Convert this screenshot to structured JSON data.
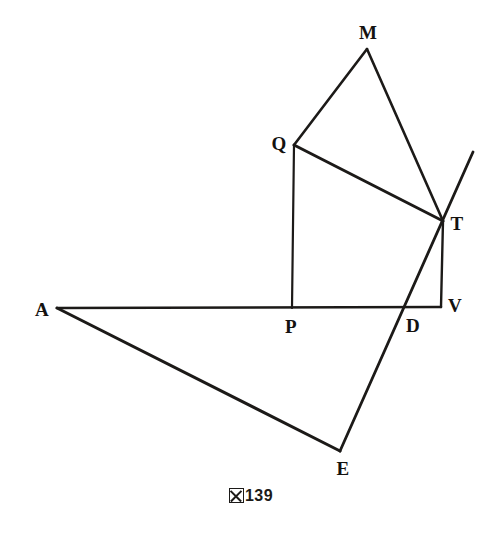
{
  "figure": {
    "caption_symbol": "図",
    "caption_number": "139",
    "caption_full": "図139",
    "canvas": {
      "width": 502,
      "height": 534,
      "background": "#ffffff"
    },
    "stroke_color": "#1c1a18",
    "label_color": "#141210",
    "points": [
      {
        "id": "M",
        "label": "M",
        "x": 367,
        "y": 49,
        "label_x": 368,
        "label_y": 32
      },
      {
        "id": "Q",
        "label": "Q",
        "x": 294,
        "y": 145,
        "label_x": 279,
        "label_y": 143
      },
      {
        "id": "T",
        "label": "T",
        "x": 443,
        "y": 221,
        "label_x": 457,
        "label_y": 223
      },
      {
        "id": "R",
        "label": "",
        "x": 473,
        "y": 152,
        "label_x": 473,
        "label_y": 152
      },
      {
        "id": "P",
        "label": "P",
        "x": 292,
        "y": 308,
        "label_x": 291,
        "label_y": 326
      },
      {
        "id": "D",
        "label": "D",
        "x": 402,
        "y": 307,
        "label_x": 413,
        "label_y": 325
      },
      {
        "id": "V",
        "label": "V",
        "x": 441,
        "y": 307,
        "label_x": 455,
        "label_y": 305
      },
      {
        "id": "A",
        "label": "A",
        "x": 57,
        "y": 308,
        "label_x": 42,
        "label_y": 309
      },
      {
        "id": "E",
        "label": "E",
        "x": 340,
        "y": 451,
        "label_x": 343,
        "label_y": 468
      }
    ],
    "edges": [
      {
        "name": "segment-Q-M",
        "from": "Q",
        "to": "M",
        "width": 2.6
      },
      {
        "name": "segment-M-T",
        "from": "M",
        "to": "T",
        "width": 2.6
      },
      {
        "name": "segment-Q-T",
        "from": "Q",
        "to": "T",
        "width": 3.0
      },
      {
        "name": "segment-Q-P",
        "from": "Q",
        "to": "P",
        "width": 2.2
      },
      {
        "name": "segment-T-V",
        "from": "T",
        "to": "V",
        "width": 2.4
      },
      {
        "name": "segment-A-V",
        "from": "A",
        "to": "V",
        "width": 2.6
      },
      {
        "name": "ray-E-T-extended",
        "from": "E",
        "to": "R",
        "width": 2.8
      },
      {
        "name": "segment-A-E",
        "from": "A",
        "to": "E",
        "width": 3.0
      }
    ]
  }
}
